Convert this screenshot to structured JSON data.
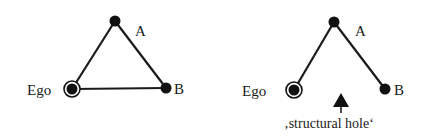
{
  "diagrams": [
    {
      "name": "closed-triad",
      "nodes": {
        "ego": {
          "label": "Ego",
          "x": 72,
          "y": 89
        },
        "a": {
          "label": "A",
          "x": 115,
          "y": 21
        },
        "b": {
          "label": "B",
          "x": 166,
          "y": 88
        }
      },
      "edges": [
        [
          "ego",
          "a"
        ],
        [
          "a",
          "b"
        ],
        [
          "ego",
          "b"
        ]
      ]
    },
    {
      "name": "open-triad",
      "nodes": {
        "ego": {
          "label": "Ego",
          "x": 294,
          "y": 90
        },
        "a": {
          "label": "A",
          "x": 334,
          "y": 22
        },
        "b": {
          "label": "B",
          "x": 385,
          "y": 89
        }
      },
      "edges": [
        [
          "ego",
          "a"
        ],
        [
          "a",
          "b"
        ]
      ],
      "annotation": {
        "label": "‚structural hole‘",
        "arrow": "up-arrow"
      }
    }
  ],
  "colors": {
    "node": "#111111",
    "edge": "#1a1a1a",
    "background": "#ffffff"
  }
}
